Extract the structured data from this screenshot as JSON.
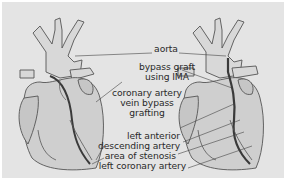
{
  "diagram": {
    "colors": {
      "background": "#e4e4e4",
      "heart_fill": "#cfcfcf",
      "vessel_fill": "#d6d6d6",
      "outline": "#555555",
      "graft": "#3a3a3a",
      "label_text": "#2a2a2a"
    },
    "figures": [
      {
        "name": "heart-with-vein-graft",
        "position": "left"
      },
      {
        "name": "heart-with-ima-graft",
        "position": "right"
      }
    ],
    "labels": {
      "aorta": "aorta",
      "bypass_graft_line1": "bypass graft",
      "bypass_graft_line2": "using IMA",
      "vein_graft_line1": "coronary artery",
      "vein_graft_line2": "vein bypass",
      "vein_graft_line3": "grafting",
      "lad_line1": "left anterior",
      "lad_line2": "descending artery",
      "stenosis": "area of stenosis",
      "left_coronary": "left coronary artery"
    }
  }
}
